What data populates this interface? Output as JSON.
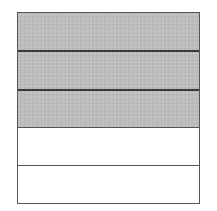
{
  "diagram": {
    "type": "fraction-bar",
    "orientation": "horizontal-strips",
    "total_parts": 5,
    "shaded_parts": 3,
    "fraction": "3/5",
    "colors": {
      "shaded": "#bdbdbd",
      "empty": "#ffffff",
      "border": "#555555"
    },
    "strips": [
      {
        "index": 1,
        "shaded": true
      },
      {
        "index": 2,
        "shaded": true
      },
      {
        "index": 3,
        "shaded": true
      },
      {
        "index": 4,
        "shaded": false
      },
      {
        "index": 5,
        "shaded": false
      }
    ]
  }
}
